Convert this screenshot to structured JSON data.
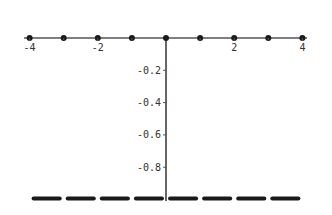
{
  "chart_data": {
    "type": "scatter",
    "title": "",
    "xlabel": "",
    "ylabel": "",
    "xlim": [
      -4,
      4
    ],
    "ylim": [
      -1,
      0
    ],
    "grid": false,
    "x_ticks": [
      {
        "value": -4,
        "label": "-4"
      },
      {
        "value": -2,
        "label": "-2"
      },
      {
        "value": 2,
        "label": "2"
      },
      {
        "value": 4,
        "label": "4"
      }
    ],
    "y_ticks": [
      {
        "value": -0.2,
        "label": "-0.2"
      },
      {
        "value": -0.4,
        "label": "-0.4"
      },
      {
        "value": -0.6,
        "label": "-0.6"
      },
      {
        "value": -0.8,
        "label": "-0.8"
      }
    ],
    "series": [
      {
        "name": "points at integers",
        "style": "dots",
        "x": [
          -4,
          -3,
          -2,
          -1,
          0,
          1,
          2,
          3,
          4
        ],
        "y": [
          0,
          0,
          0,
          0,
          0,
          0,
          0,
          0,
          0
        ]
      },
      {
        "name": "segments between integers",
        "style": "horizontal-segments",
        "segments": [
          {
            "x0": -4,
            "x1": -3,
            "y": -1
          },
          {
            "x0": -3,
            "x1": -2,
            "y": -1
          },
          {
            "x0": -2,
            "x1": -1,
            "y": -1
          },
          {
            "x0": -1,
            "x1": 0,
            "y": -1
          },
          {
            "x0": 0,
            "x1": 1,
            "y": -1
          },
          {
            "x0": 1,
            "x1": 2,
            "y": -1
          },
          {
            "x0": 2,
            "x1": 3,
            "y": -1
          },
          {
            "x0": 3,
            "x1": 4,
            "y": -1
          }
        ]
      }
    ],
    "colors": {
      "axis": "#555555",
      "points": "#1a1a1a",
      "segments": "#1a1a1a"
    }
  }
}
